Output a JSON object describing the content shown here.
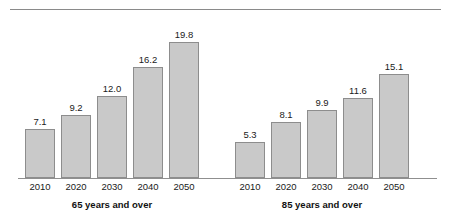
{
  "chart_data": {
    "type": "bar",
    "title": "",
    "subtitle": "",
    "xlabel": "",
    "ylabel": "",
    "grid": false,
    "legend": "none",
    "axis_baseline_value": 0,
    "value_format": "one-decimal",
    "categories": [
      "2010",
      "2020",
      "2030",
      "2040",
      "2050"
    ],
    "groups": [
      {
        "name": "65 years and over",
        "label": "65 years and over",
        "categories": [
          "2010",
          "2020",
          "2030",
          "2040",
          "2050"
        ],
        "values": [
          7.1,
          9.2,
          12.0,
          16.2,
          19.8
        ],
        "value_labels": [
          "7.1",
          "9.2",
          "12.0",
          "16.2",
          "19.8"
        ]
      },
      {
        "name": "85 years and over",
        "label": "85 years and over",
        "categories": [
          "2010",
          "2020",
          "2030",
          "2040",
          "2050"
        ],
        "values": [
          5.3,
          8.1,
          9.9,
          11.6,
          15.1
        ],
        "value_labels": [
          "5.3",
          "8.1",
          "9.9",
          "11.6",
          "15.1"
        ]
      }
    ],
    "series": [
      {
        "name": "65 years and over",
        "values": [
          7.1,
          9.2,
          12.0,
          16.2,
          19.8
        ]
      },
      {
        "name": "85 years and over",
        "values": [
          5.3,
          8.1,
          9.9,
          11.6,
          15.1
        ]
      }
    ],
    "ylim": [
      0,
      19.8
    ],
    "colors": {
      "bar_fill": "#c9c9c9",
      "bar_border": "#8d8d8d",
      "axis": "#8f8f8f",
      "rule": "#8a8a8a",
      "text": "#1a1a1a"
    }
  }
}
